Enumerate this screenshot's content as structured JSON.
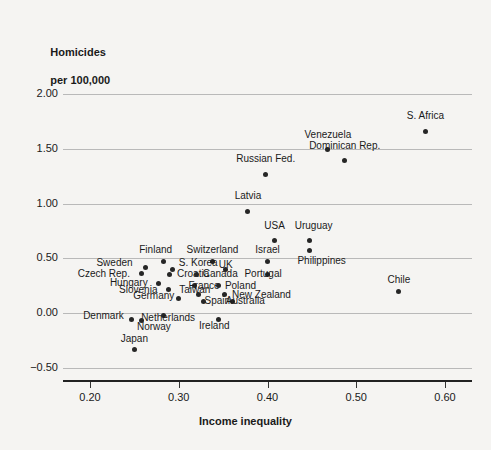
{
  "chart_data": {
    "type": "scatter",
    "title": "Homicides per 100,000",
    "ylabel_line1": "Homicides",
    "ylabel_line2": "per 100,000",
    "xlabel": "Income inequality",
    "xlim": [
      0.175,
      0.625
    ],
    "ylim": [
      -0.7,
      2.15
    ],
    "xticks": [
      0.2,
      0.3,
      0.4,
      0.5,
      0.6
    ],
    "xtick_labels": [
      "0.20",
      "0.30",
      "0.40",
      "0.50",
      "0.60"
    ],
    "yticks": [
      2.0,
      1.5,
      1.0,
      0.5,
      0.0,
      -0.5
    ],
    "ytick_labels": [
      "2.00",
      "1.50",
      "1.00",
      "0.50",
      "0.00",
      "−0.50"
    ],
    "grid": "horizontal",
    "legend": "none",
    "marker_color": "#262626",
    "grid_color": "#b9b9b9",
    "points": [
      {
        "label": "S. Africa",
        "x": 0.578,
        "y": 1.66,
        "lx": 0.578,
        "ly": 1.8,
        "anchor": "center"
      },
      {
        "label": "Venezuela",
        "x": 0.468,
        "y": 1.49,
        "lx": 0.468,
        "ly": 1.63,
        "anchor": "center"
      },
      {
        "label": "Dominican Rep.",
        "x": 0.487,
        "y": 1.39,
        "lx": 0.487,
        "ly": 1.53,
        "anchor": "center"
      },
      {
        "label": "Russian Fed.",
        "x": 0.398,
        "y": 1.27,
        "lx": 0.398,
        "ly": 1.41,
        "anchor": "center"
      },
      {
        "label": "Latvia",
        "x": 0.378,
        "y": 0.93,
        "lx": 0.378,
        "ly": 1.07,
        "anchor": "center"
      },
      {
        "label": "USA",
        "x": 0.408,
        "y": 0.66,
        "lx": 0.408,
        "ly": 0.8,
        "anchor": "center"
      },
      {
        "label": "Uruguay",
        "x": 0.447,
        "y": 0.66,
        "lx": 0.452,
        "ly": 0.8,
        "anchor": "center"
      },
      {
        "label": "Philippines",
        "x": 0.447,
        "y": 0.57,
        "lx": 0.461,
        "ly": 0.48,
        "anchor": "center"
      },
      {
        "label": "Israel",
        "x": 0.4,
        "y": 0.47,
        "lx": 0.4,
        "ly": 0.58,
        "anchor": "center"
      },
      {
        "label": "Switzerland",
        "x": 0.338,
        "y": 0.47,
        "lx": 0.338,
        "ly": 0.58,
        "anchor": "center"
      },
      {
        "label": "Finland",
        "x": 0.283,
        "y": 0.47,
        "lx": 0.274,
        "ly": 0.58,
        "anchor": "center"
      },
      {
        "label": "Sweden",
        "x": 0.262,
        "y": 0.42,
        "lx": 0.248,
        "ly": 0.46,
        "anchor": "right"
      },
      {
        "label": "S. Korea",
        "x": 0.293,
        "y": 0.4,
        "lx": 0.3,
        "ly": 0.46,
        "anchor": "left"
      },
      {
        "label": "Czech Rep.",
        "x": 0.258,
        "y": 0.36,
        "lx": 0.245,
        "ly": 0.355,
        "anchor": "right"
      },
      {
        "label": "Croatia",
        "x": 0.29,
        "y": 0.355,
        "lx": 0.298,
        "ly": 0.355,
        "anchor": "left"
      },
      {
        "label": "Canada",
        "x": 0.32,
        "y": 0.355,
        "lx": 0.327,
        "ly": 0.355,
        "anchor": "left"
      },
      {
        "label": "UK",
        "x": 0.353,
        "y": 0.4,
        "lx": 0.353,
        "ly": 0.44,
        "anchor": "center"
      },
      {
        "label": "Portugal",
        "x": 0.4,
        "y": 0.355,
        "lx": 0.374,
        "ly": 0.355,
        "anchor": "left"
      },
      {
        "label": "Hungary",
        "x": 0.277,
        "y": 0.27,
        "lx": 0.265,
        "ly": 0.275,
        "anchor": "right"
      },
      {
        "label": "France",
        "x": 0.318,
        "y": 0.25,
        "lx": 0.311,
        "ly": 0.245,
        "anchor": "left"
      },
      {
        "label": "Poland",
        "x": 0.345,
        "y": 0.25,
        "lx": 0.352,
        "ly": 0.245,
        "anchor": "left"
      },
      {
        "label": "Slovenia",
        "x": 0.288,
        "y": 0.22,
        "lx": 0.276,
        "ly": 0.215,
        "anchor": "right"
      },
      {
        "label": "Taiwan",
        "x": 0.322,
        "y": 0.175,
        "lx": 0.318,
        "ly": 0.215,
        "anchor": "center"
      },
      {
        "label": "New Zealand",
        "x": 0.352,
        "y": 0.175,
        "lx": 0.36,
        "ly": 0.165,
        "anchor": "left"
      },
      {
        "label": "Germany",
        "x": 0.3,
        "y": 0.13,
        "lx": 0.295,
        "ly": 0.155,
        "anchor": "right"
      },
      {
        "label": "Spain",
        "x": 0.328,
        "y": 0.105,
        "lx": 0.329,
        "ly": 0.115,
        "anchor": "left"
      },
      {
        "label": "Australia",
        "x": 0.36,
        "y": 0.105,
        "lx": 0.353,
        "ly": 0.115,
        "anchor": "left"
      },
      {
        "label": "Netherlands",
        "x": 0.283,
        "y": -0.02,
        "lx": 0.288,
        "ly": -0.04,
        "anchor": "center"
      },
      {
        "label": "Ireland",
        "x": 0.345,
        "y": -0.06,
        "lx": 0.34,
        "ly": -0.12,
        "anchor": "center"
      },
      {
        "label": "Denmark",
        "x": 0.247,
        "y": -0.06,
        "lx": 0.238,
        "ly": -0.03,
        "anchor": "right"
      },
      {
        "label": "Norway",
        "x": 0.258,
        "y": -0.07,
        "lx": 0.272,
        "ly": -0.13,
        "anchor": "center"
      },
      {
        "label": "Japan",
        "x": 0.25,
        "y": -0.33,
        "lx": 0.25,
        "ly": -0.235,
        "anchor": "center"
      },
      {
        "label": "Chile",
        "x": 0.548,
        "y": 0.195,
        "lx": 0.548,
        "ly": 0.3,
        "anchor": "center"
      }
    ]
  }
}
